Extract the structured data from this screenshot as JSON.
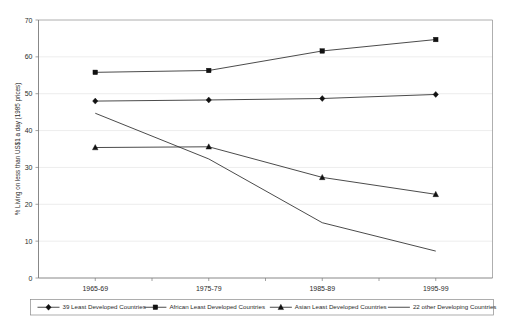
{
  "chart_data": {
    "type": "line",
    "title": "",
    "xlabel": "",
    "ylabel": "% Living on less than US$1 a day (1985 prices)",
    "categories": [
      "1965-69",
      "1975-79",
      "1985-89",
      "1995-99"
    ],
    "ylim": [
      0,
      70
    ],
    "ytick_step": 10,
    "yticks": [
      "0",
      "10",
      "20",
      "30",
      "40",
      "50",
      "60",
      "70"
    ],
    "grid": true,
    "legend_position": "bottom",
    "series": [
      {
        "name": "39 Least Developed Countries",
        "marker": "diamond",
        "values": [
          48.0,
          48.3,
          48.7,
          49.8
        ]
      },
      {
        "name": "African Least Developed Countries",
        "marker": "square",
        "values": [
          55.8,
          56.3,
          61.6,
          64.7
        ]
      },
      {
        "name": "Asian Least Developed Countries",
        "marker": "triangle",
        "values": [
          35.4,
          35.6,
          27.3,
          22.7
        ]
      },
      {
        "name": "22 other Developing Countries",
        "marker": "none",
        "values": [
          44.7,
          32.3,
          15.0,
          7.3
        ]
      }
    ]
  },
  "colors": {
    "series": "#111111",
    "gridline": "#e4e4e4",
    "axis": "#7a7a7a",
    "frame": "#9a9a9a",
    "text": "#2b2b2b",
    "background": "#ffffff"
  }
}
